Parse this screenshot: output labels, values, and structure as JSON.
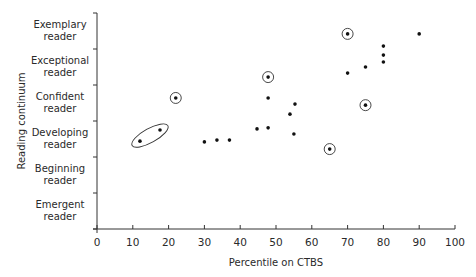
{
  "chart_data": {
    "type": "scatter",
    "title": "",
    "xlabel": "Percentile on CTBS",
    "ylabel": "Reading continuum",
    "xlim": [
      0,
      100
    ],
    "xticks": [
      0,
      10,
      20,
      30,
      40,
      50,
      60,
      70,
      80,
      90,
      100
    ],
    "ylim": [
      0,
      6
    ],
    "y_categories": [
      "Emergent reader",
      "Beginning reader",
      "Developing reader",
      "Confident reader",
      "Exceptional reader",
      "Exemplary reader"
    ],
    "grid": false,
    "legend": null,
    "points": [
      {
        "x": 12,
        "y": 2.44,
        "circled": false,
        "group": "ellipse"
      },
      {
        "x": 17.6,
        "y": 2.75,
        "circled": false,
        "group": "ellipse"
      },
      {
        "x": 22,
        "y": 3.64,
        "circled": true
      },
      {
        "x": 30,
        "y": 2.42,
        "circled": false
      },
      {
        "x": 33.5,
        "y": 2.47,
        "circled": false
      },
      {
        "x": 37,
        "y": 2.47,
        "circled": false
      },
      {
        "x": 44.7,
        "y": 2.78,
        "circled": false
      },
      {
        "x": 47.8,
        "y": 2.81,
        "circled": false
      },
      {
        "x": 47.8,
        "y": 4.22,
        "circled": true
      },
      {
        "x": 47.8,
        "y": 3.64,
        "circled": false
      },
      {
        "x": 55.3,
        "y": 3.47,
        "circled": false
      },
      {
        "x": 53.9,
        "y": 3.19,
        "circled": false
      },
      {
        "x": 55,
        "y": 2.64,
        "circled": false
      },
      {
        "x": 65,
        "y": 2.22,
        "circled": true
      },
      {
        "x": 70,
        "y": 5.42,
        "circled": true
      },
      {
        "x": 70,
        "y": 4.33,
        "circled": false
      },
      {
        "x": 75,
        "y": 4.5,
        "circled": false
      },
      {
        "x": 75,
        "y": 3.44,
        "circled": true
      },
      {
        "x": 80,
        "y": 5.08,
        "circled": false
      },
      {
        "x": 80,
        "y": 4.83,
        "circled": false
      },
      {
        "x": 80,
        "y": 4.64,
        "circled": false
      },
      {
        "x": 90,
        "y": 5.42,
        "circled": false
      }
    ],
    "annotations": [
      {
        "type": "ellipse",
        "encloses": "ellipse-group points (x≈12–18, Developing reader)"
      },
      {
        "type": "ring",
        "count": 5,
        "description": "individual circled points"
      }
    ]
  },
  "colors": {
    "axis": "#333333",
    "point": "#111111",
    "text": "#2a2a2a",
    "background": "#ffffff"
  }
}
